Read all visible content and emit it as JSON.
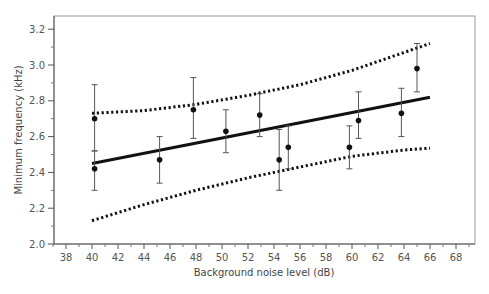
{
  "chart_data": {
    "type": "scatter",
    "title": "",
    "xlabel": "Background noise level (dB)",
    "ylabel": "Minimum frequency (kHz)",
    "xlim": [
      37,
      69.5
    ],
    "ylim": [
      2.0,
      3.27
    ],
    "x_ticks": [
      38,
      40,
      42,
      44,
      46,
      48,
      50,
      52,
      54,
      56,
      58,
      60,
      62,
      64,
      66,
      68
    ],
    "y_ticks": [
      2.0,
      2.2,
      2.4,
      2.6,
      2.8,
      3.0,
      3.2
    ],
    "grid": false,
    "legend": null,
    "series": [
      {
        "name": "observations (mean ± error)",
        "style": "points-with-error-bars",
        "points": [
          {
            "x": 40.2,
            "y": 2.7,
            "ylo": 2.52,
            "yhi": 2.89
          },
          {
            "x": 40.2,
            "y": 2.42,
            "ylo": 2.3,
            "yhi": 2.52
          },
          {
            "x": 45.2,
            "y": 2.47,
            "ylo": 2.34,
            "yhi": 2.6
          },
          {
            "x": 47.8,
            "y": 2.75,
            "ylo": 2.59,
            "yhi": 2.93
          },
          {
            "x": 50.3,
            "y": 2.63,
            "ylo": 2.51,
            "yhi": 2.75
          },
          {
            "x": 52.9,
            "y": 2.72,
            "ylo": 2.6,
            "yhi": 2.84
          },
          {
            "x": 54.4,
            "y": 2.47,
            "ylo": 2.3,
            "yhi": 2.64
          },
          {
            "x": 55.1,
            "y": 2.54,
            "ylo": 2.42,
            "yhi": 2.66
          },
          {
            "x": 59.8,
            "y": 2.54,
            "ylo": 2.42,
            "yhi": 2.66
          },
          {
            "x": 60.5,
            "y": 2.69,
            "ylo": 2.59,
            "yhi": 2.85
          },
          {
            "x": 63.8,
            "y": 2.73,
            "ylo": 2.6,
            "yhi": 2.87
          },
          {
            "x": 65.0,
            "y": 2.98,
            "ylo": 2.85,
            "yhi": 3.12
          }
        ]
      },
      {
        "name": "regression line",
        "style": "solid",
        "x": [
          40,
          66
        ],
        "y": [
          2.45,
          2.82
        ]
      },
      {
        "name": "upper confidence band",
        "style": "dotted",
        "x": [
          40,
          44,
          48,
          52,
          56,
          60,
          64,
          66
        ],
        "y": [
          2.73,
          2.745,
          2.78,
          2.83,
          2.89,
          2.97,
          3.07,
          3.12
        ]
      },
      {
        "name": "lower confidence band",
        "style": "dotted",
        "x": [
          40,
          44,
          48,
          52,
          56,
          60,
          64,
          66
        ],
        "y": [
          2.13,
          2.22,
          2.3,
          2.37,
          2.43,
          2.49,
          2.525,
          2.535
        ]
      }
    ]
  }
}
